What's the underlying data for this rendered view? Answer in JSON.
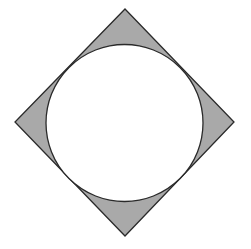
{
  "title": "Circle inscribed in a square rotated 45 degrees (diamond) with shaded corner regions",
  "colors": {
    "background": "#ffffff",
    "shaded_fill": "#a9a9a9",
    "stroke": "#2a2a2a",
    "circle_fill": "#ffffff"
  },
  "diamond": {
    "points": [
      [
        125,
        9
      ],
      [
        234,
        122
      ],
      [
        125,
        236
      ],
      [
        15,
        122
      ]
    ]
  },
  "circle": {
    "cx": 124.5,
    "cy": 123,
    "r": 78.5
  },
  "stroke_width": 1.3
}
